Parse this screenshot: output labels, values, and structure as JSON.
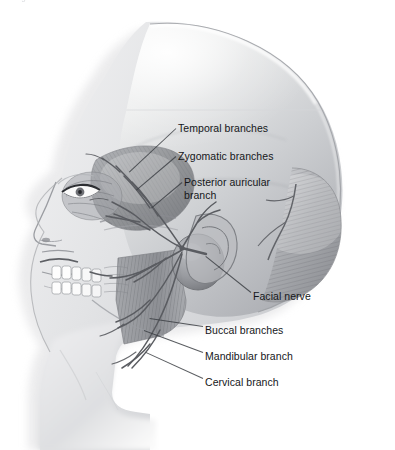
{
  "figure": {
    "top_caption_fragment": "Figure — branches of the facial nerve",
    "view": "lateral profile, facing left",
    "style": "grayscale medical illustration",
    "colors": {
      "background": "#ffffff",
      "ink": "#15171a",
      "leader_line": "#3c3f44",
      "skin_light": "#f0f0f1",
      "skin_mid": "#d2d3d6",
      "skin_shade": "#a8aaae",
      "muscle_mid": "#9fa1a6",
      "muscle_dark": "#74767b",
      "nerve": "#5f6166",
      "cranium_light": "#fbfbfb",
      "cranium_mid": "#c9cbce",
      "cranium_dark": "#8e9095",
      "shadow": "#e3e3e5",
      "tooth": "#fdfdfd"
    }
  },
  "labels": [
    {
      "id": "temporal",
      "text": "Temporal branches",
      "x": 178,
      "y": 122,
      "lines": 1
    },
    {
      "id": "zygomatic",
      "text": "Zygomatic branches",
      "x": 178,
      "y": 150,
      "lines": 1
    },
    {
      "id": "posterior_auricular",
      "text": "Posterior auricular branch",
      "x": 184,
      "y": 176,
      "lines": 2
    },
    {
      "id": "facial_nerve",
      "text": "Facial nerve",
      "x": 253,
      "y": 290,
      "lines": 1
    },
    {
      "id": "buccal",
      "text": "Buccal branches",
      "x": 205,
      "y": 324,
      "lines": 1
    },
    {
      "id": "mandibular",
      "text": "Mandibular branch",
      "x": 205,
      "y": 350,
      "lines": 1
    },
    {
      "id": "cervical",
      "text": "Cervical branch",
      "x": 205,
      "y": 376,
      "lines": 1
    }
  ],
  "leaders": [
    {
      "id": "lead-temporal",
      "x1": 176,
      "y1": 128,
      "x2": 129,
      "y2": 172
    },
    {
      "id": "lead-zygomatic",
      "x1": 176,
      "y1": 156,
      "x2": 136,
      "y2": 190
    },
    {
      "id": "lead-posterior",
      "x1": 182,
      "y1": 182,
      "x2": 151,
      "y2": 208
    },
    {
      "id": "lead-facial",
      "x1": 251,
      "y1": 292,
      "x2": 206,
      "y2": 256
    },
    {
      "id": "lead-buccal",
      "x1": 203,
      "y1": 326,
      "x2": 150,
      "y2": 318
    },
    {
      "id": "lead-mandibular",
      "x1": 203,
      "y1": 352,
      "x2": 144,
      "y2": 330
    },
    {
      "id": "lead-cervical",
      "x1": 203,
      "y1": 378,
      "x2": 146,
      "y2": 352
    }
  ],
  "structures": [
    {
      "id": "cranium",
      "name": "Cranial vault / scalp"
    },
    {
      "id": "occipitalis",
      "name": "Occipitalis muscle (striated fibers, posterior head)"
    },
    {
      "id": "temporalis",
      "name": "Temporalis muscle (fan-shaped, temple)"
    },
    {
      "id": "orbicularis-oculi",
      "name": "Orbicularis oculi muscle"
    },
    {
      "id": "eye",
      "name": "Eye and eyelid"
    },
    {
      "id": "nose",
      "name": "Nose"
    },
    {
      "id": "lips",
      "name": "Lips and mouth"
    },
    {
      "id": "teeth",
      "name": "Upper and lower teeth"
    },
    {
      "id": "masseter",
      "name": "Masseter muscle (vertical fibers over ramus)"
    },
    {
      "id": "parotid",
      "name": "Parotid gland region"
    },
    {
      "id": "ear",
      "name": "Auricle (external ear)"
    },
    {
      "id": "mandible",
      "name": "Mandible / jaw line"
    },
    {
      "id": "neck",
      "name": "Neck and shoulder"
    },
    {
      "id": "nerve-trunk",
      "name": "Facial nerve trunk at stylomastoid foramen"
    },
    {
      "id": "nerve-plexus",
      "name": "Parotid plexus — pes anserinus"
    }
  ]
}
